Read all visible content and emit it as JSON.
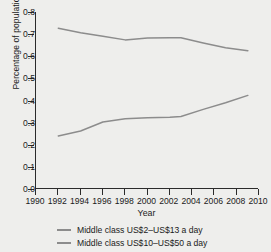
{
  "chart_data": {
    "type": "line",
    "title": "",
    "xlabel": "Year",
    "ylabel": "Percentage of population",
    "xlim": [
      1990,
      2010
    ],
    "ylim": [
      0.0,
      0.8
    ],
    "grid": false,
    "legend_position": "bottom",
    "xticks": [
      "1990",
      "1992",
      "1994",
      "1996",
      "1998",
      "2000",
      "2002",
      "2004",
      "2006",
      "2008",
      "2010"
    ],
    "yticks": [
      "0.0",
      "0.1",
      "0.2",
      "0.3",
      "0.4",
      "0.5",
      "0.6",
      "0.7",
      "0.8"
    ],
    "x": [
      1992,
      1994,
      1996,
      1998,
      2000,
      2002,
      2003,
      2005,
      2007,
      2009
    ],
    "series": [
      {
        "name": "Middle class US$2–US$13 a day",
        "color": "#8c8c8c",
        "values": [
          0.727,
          0.706,
          0.69,
          0.674,
          0.682,
          0.684,
          0.684,
          0.66,
          0.638,
          0.625
        ]
      },
      {
        "name": "Middle class US$10–US$50 a day",
        "color": "#8c8c8c",
        "values": [
          0.24,
          0.262,
          0.303,
          0.318,
          0.322,
          0.324,
          0.328,
          0.36,
          0.39,
          0.423
        ]
      }
    ]
  },
  "legend": {
    "items": [
      {
        "label": "Middle class US$2–US$13 a day",
        "color": "#8c8c8c"
      },
      {
        "label": "Middle class US$10–US$50 a day",
        "color": "#8c8c8c"
      }
    ]
  }
}
